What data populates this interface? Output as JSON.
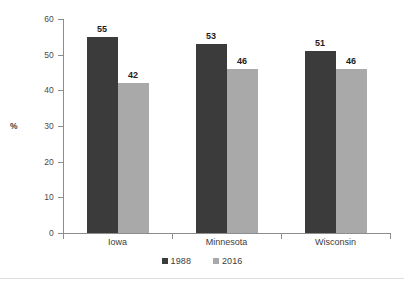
{
  "chart_data": {
    "type": "bar",
    "title": "",
    "xlabel": "",
    "ylabel": "%",
    "categories": [
      "Iowa",
      "Minnesota",
      "Wisconsin"
    ],
    "series": [
      {
        "name": "1988",
        "color": "#3b3b3b",
        "values": [
          55,
          53,
          51
        ]
      },
      {
        "name": "2016",
        "color": "#a9a9a9",
        "values": [
          42,
          46,
          46
        ]
      }
    ],
    "ylim": [
      0,
      60
    ],
    "ytick_step": 10,
    "ytick_labels": [
      "60",
      "50",
      "40",
      "30",
      "20",
      "10",
      "0"
    ],
    "ytick_values": [
      60,
      50,
      40,
      30,
      20,
      10,
      0
    ],
    "data_labels": [
      [
        "55",
        "42"
      ],
      [
        "53",
        "46"
      ],
      [
        "51",
        "46"
      ]
    ],
    "grid": false,
    "legend_position": "bottom",
    "legend_entries": [
      "1988",
      "2016"
    ],
    "axis_color": "#8d8d8d"
  }
}
